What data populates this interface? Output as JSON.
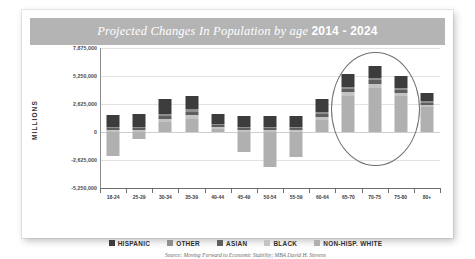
{
  "card": {
    "title_main": "Projected Changes In Population by age",
    "title_years": "2014 - 2024",
    "source": "Source: Moving Forward to Economic Stability; MBA David H. Stevens"
  },
  "colors": {
    "title_band": "#b4b4b4",
    "hispanic": "#3c3c3c",
    "other": "#8e8e8e",
    "asian": "#5f5f5f",
    "black": "#c3c3c3",
    "non_hisp_white": "#b0b0b0",
    "ellipse": "#6f6f6f",
    "grid": "#e2e2e2"
  },
  "annotation": {
    "shape": "ellipse",
    "highlights": [
      "65-70",
      "70-75",
      "75-80"
    ]
  },
  "chart_data": {
    "type": "bar",
    "stacked": true,
    "title": "Projected Changes In Population by age 2014 - 2024",
    "xlabel": "",
    "ylabel": "MILLIONS",
    "ylim": [
      -5250000,
      7875000
    ],
    "ytick_labels": [
      "7,875,000",
      "5,250,000",
      "2,625,000",
      "0",
      "-2,625,000",
      "-5,250,000"
    ],
    "ytick_values": [
      7875000,
      5250000,
      2625000,
      0,
      -2625000,
      -5250000
    ],
    "grid": true,
    "legend_position": "bottom",
    "categories": [
      "18-24",
      "25-29",
      "30-34",
      "35-39",
      "40-44",
      "45-49",
      "50-54",
      "55-59",
      "60-64",
      "65-70",
      "70-75",
      "75-80",
      "80+"
    ],
    "series": [
      {
        "name": "NON-HISP. WHITE",
        "color": "#b0b0b0",
        "values": [
          -2250000,
          -700000,
          900000,
          1250000,
          250000,
          -1900000,
          -3250000,
          -2350000,
          1150000,
          3400000,
          4150000,
          3400000,
          2350000
        ]
      },
      {
        "name": "BLACK",
        "color": "#c3c3c3",
        "values": [
          180000,
          200000,
          330000,
          330000,
          200000,
          180000,
          180000,
          180000,
          280000,
          330000,
          360000,
          280000,
          200000
        ]
      },
      {
        "name": "ASIAN",
        "color": "#5f5f5f",
        "values": [
          160000,
          180000,
          300000,
          330000,
          160000,
          160000,
          160000,
          160000,
          250000,
          330000,
          350000,
          300000,
          180000
        ]
      },
      {
        "name": "OTHER",
        "color": "#8e8e8e",
        "values": [
          120000,
          130000,
          180000,
          200000,
          120000,
          120000,
          120000,
          120000,
          160000,
          200000,
          210000,
          180000,
          130000
        ]
      },
      {
        "name": "HISPANIC",
        "color": "#3c3c3c",
        "values": [
          1150000,
          1150000,
          1350000,
          1250000,
          1000000,
          1000000,
          1000000,
          1000000,
          1300000,
          1200000,
          1150000,
          1050000,
          800000
        ]
      }
    ],
    "legend": [
      "HISPANIC",
      "OTHER",
      "ASIAN",
      "BLACK",
      "NON-HISP. WHITE"
    ]
  }
}
